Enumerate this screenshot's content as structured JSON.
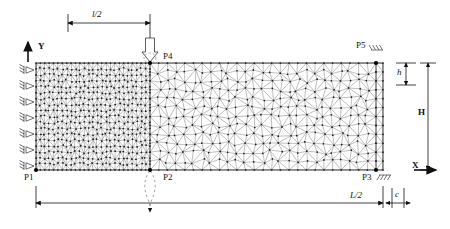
{
  "figure": {
    "type": "fem-mesh-diagram",
    "colors": {
      "mesh_line": "#4a4a4a",
      "node": "#1a1a1a",
      "outline": "#2b2b2b",
      "dimension": "#1a1a1a",
      "dashed": "#6b6b6b"
    }
  },
  "axes": {
    "y_label": "Y",
    "x_label": "X"
  },
  "dimensions": {
    "top_span": "l/2",
    "bottom_span": "L/2",
    "height_total": "H",
    "height_small": "h",
    "edge_small": "c"
  },
  "points": {
    "p1": "P1",
    "p2": "P2",
    "p3": "P3",
    "p4": "P4",
    "p5": "P5"
  },
  "load": {
    "name": "point-load-arrow",
    "direction": "down",
    "at_point": "P4"
  },
  "supports": {
    "left_edge_roller_count": 7,
    "p3_fixed": true,
    "p5_fixed": true
  },
  "mesh": {
    "element_type": "triangle",
    "region_fine": "left half",
    "region_coarse": "right half",
    "bounds": {
      "x0": 36,
      "y0": 63,
      "x1": 383,
      "y1": 170
    }
  }
}
